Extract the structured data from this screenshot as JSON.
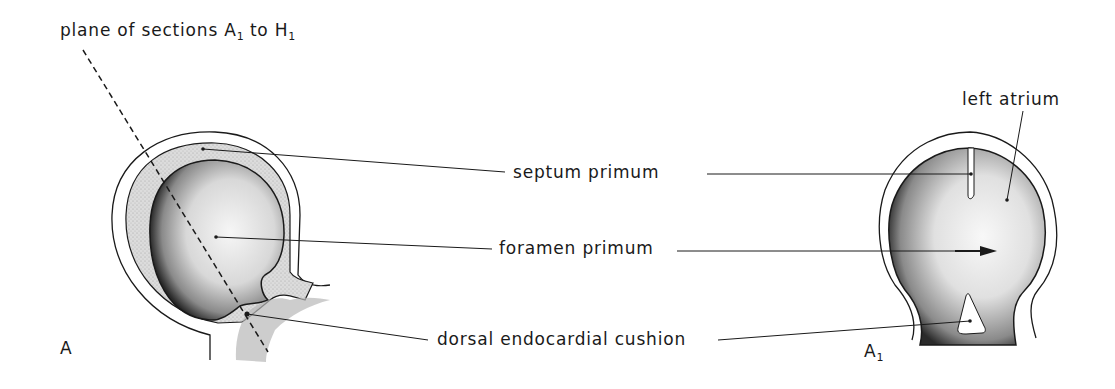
{
  "figure": {
    "title_label": {
      "text": "plane of sections A",
      "sub1": "1",
      "mid": " to H",
      "sub2": "1"
    },
    "panel_left": {
      "label": "A"
    },
    "panel_right": {
      "label": "A",
      "label_sub": "1"
    },
    "labels": {
      "septum_primum": "septum primum",
      "foramen_primum": "foramen primum",
      "dorsal_endocardial_cushion": "dorsal  endocardial cushion",
      "left_atrium": "left atrium"
    },
    "colors": {
      "ink": "#1a1a1a",
      "stipple_dark": "#2a2a2a",
      "stipple_light": "#f2f2f2",
      "septum_fill": "#dcdcdc",
      "background": "#ffffff"
    }
  }
}
